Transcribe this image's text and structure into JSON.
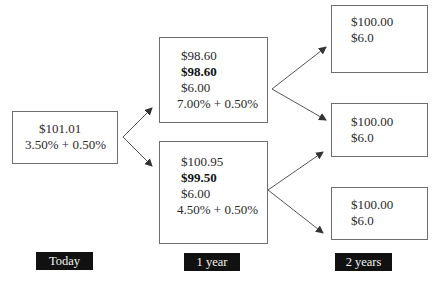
{
  "diagram": {
    "title": "",
    "nodes": {
      "today": {
        "lines": [
          "$101.01",
          "3.50% + 0.50%"
        ]
      },
      "y1_up": {
        "lines": [
          "$98.60",
          "$98.60",
          "$6.00",
          "7.00% + 0.50%"
        ],
        "bold_line_index": 1
      },
      "y1_down": {
        "lines": [
          "$100.95",
          "$99.50",
          "$6.00",
          "4.50% + 0.50%"
        ],
        "bold_line_index": 1
      },
      "y2_top": {
        "lines": [
          "$100.00",
          "$6.0"
        ]
      },
      "y2_mid": {
        "lines": [
          "$100.00",
          "$6.0"
        ]
      },
      "y2_bottom": {
        "lines": [
          "$100.00",
          "$6.0"
        ]
      }
    },
    "edges": [
      {
        "from": "today",
        "to": "y1_up"
      },
      {
        "from": "today",
        "to": "y1_down"
      },
      {
        "from": "y1_up",
        "to": "y2_top"
      },
      {
        "from": "y1_up",
        "to": "y2_mid"
      },
      {
        "from": "y1_down",
        "to": "y2_mid"
      },
      {
        "from": "y1_down",
        "to": "y2_bottom"
      }
    ],
    "time_labels": [
      "Today",
      "1 year",
      "2 years"
    ],
    "colors": {
      "border": "#6e6e6e",
      "label_bg": "#111111",
      "label_text": "#f2f2f2",
      "arrow": "#555555"
    }
  }
}
